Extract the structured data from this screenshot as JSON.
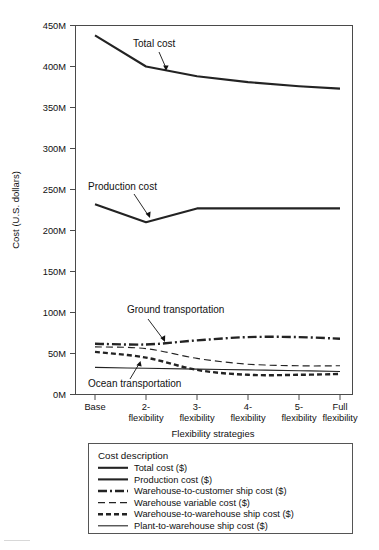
{
  "chart_data": {
    "type": "line",
    "title": "",
    "xlabel": "Flexibility strategies",
    "ylabel": "Cost (U.S. dollars)",
    "categories": [
      "Base",
      "2-flexibility",
      "3-flexibility",
      "4-flexibility",
      "5-flexibility",
      "Full flexibility"
    ],
    "x_tick_lines": [
      [
        "Base",
        ""
      ],
      [
        "2-",
        "flexibility"
      ],
      [
        "3-",
        "flexibility"
      ],
      [
        "4-",
        "flexibility"
      ],
      [
        "5-",
        "flexibility"
      ],
      [
        "Full",
        "flexibility"
      ]
    ],
    "ylim": [
      0,
      450
    ],
    "yticks": [
      0,
      50,
      100,
      150,
      200,
      250,
      300,
      350,
      400,
      450
    ],
    "ytick_labels": [
      "0M",
      "50M",
      "100M",
      "150M",
      "200M",
      "250M",
      "300M",
      "350M",
      "400M",
      "450M"
    ],
    "y_unit": "millions of U.S. dollars",
    "grid": false,
    "legend_position": "below-plot",
    "series": [
      {
        "name": "Total cost ($)",
        "style": "solid-thick",
        "values": [
          438,
          400,
          388,
          381,
          376,
          373
        ]
      },
      {
        "name": "Production cost ($)",
        "style": "solid-thick",
        "values": [
          232,
          210,
          227,
          227,
          227,
          227
        ]
      },
      {
        "name": "Warehouse-to-customer ship cost ($)",
        "style": "dash-dot-thick",
        "values": [
          62,
          61,
          66,
          70,
          70,
          68
        ]
      },
      {
        "name": "Warehouse variable cost ($)",
        "style": "dashed-thin",
        "values": [
          58,
          56,
          44,
          37,
          35,
          35
        ]
      },
      {
        "name": "Warehouse-to-warehouse ship cost ($)",
        "style": "dashed-thick",
        "values": [
          52,
          45,
          30,
          24,
          24,
          25
        ]
      },
      {
        "name": "Plant-to-warehouse ship cost ($)",
        "style": "solid-thin",
        "values": [
          33,
          32,
          31,
          30,
          29,
          28
        ]
      }
    ],
    "annotations": [
      {
        "text": "Total cost",
        "target_series": "Total cost ($)"
      },
      {
        "text": "Production cost",
        "target_series": "Production cost ($)"
      },
      {
        "text": "Ground transportation",
        "target_series": "Warehouse-to-customer ship cost ($)"
      },
      {
        "text": "Ocean transportation",
        "target_series": "Warehouse-to-warehouse ship cost ($)"
      }
    ]
  },
  "legend": {
    "title": "Cost description",
    "items": [
      {
        "label": "Total cost ($)",
        "style": "solid-thick"
      },
      {
        "label": "Production cost ($)",
        "style": "solid-thick"
      },
      {
        "label": "Warehouse-to-customer ship cost ($)",
        "style": "dash-dot-thick"
      },
      {
        "label": "Warehouse variable cost ($)",
        "style": "dashed-thin"
      },
      {
        "label": "Warehouse-to-warehouse ship cost ($)",
        "style": "dashed-thick"
      },
      {
        "label": "Plant-to-warehouse ship cost ($)",
        "style": "solid-thin"
      }
    ]
  }
}
